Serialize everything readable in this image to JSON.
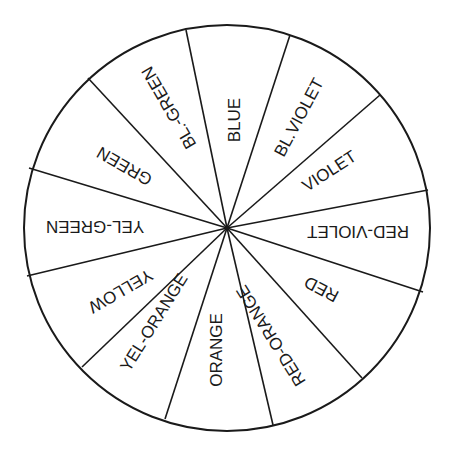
{
  "diagram": {
    "center": [
      227,
      228
    ],
    "radius": 203,
    "stroke_color": "#1a1a1a",
    "background": "#ffffff",
    "segments": [
      {
        "label": "BLUE",
        "x": 236,
        "y": 120,
        "rotate": -90
      },
      {
        "label": "BL.VIOLET",
        "x": 300,
        "y": 118,
        "rotate": -62
      },
      {
        "label": "VIOLET",
        "x": 330,
        "y": 172,
        "rotate": -33
      },
      {
        "label": "RED-VIOLET",
        "x": 358,
        "y": 230,
        "rotate": 180
      },
      {
        "label": "RED",
        "x": 322,
        "y": 288,
        "rotate": 208
      },
      {
        "label": "RED-ORANGE",
        "x": 272,
        "y": 335,
        "rotate": 238
      },
      {
        "label": "ORANGE",
        "x": 218,
        "y": 350,
        "rotate": -90
      },
      {
        "label": "YEL-ORANGE",
        "x": 155,
        "y": 323,
        "rotate": -58
      },
      {
        "label": "YELLOW",
        "x": 120,
        "y": 290,
        "rotate": 150
      },
      {
        "label": "YEL-GREEN",
        "x": 95,
        "y": 225,
        "rotate": 180
      },
      {
        "label": "GREEN",
        "x": 125,
        "y": 165,
        "rotate": 210
      },
      {
        "label": "BL.-GREEN",
        "x": 170,
        "y": 107,
        "rotate": 240
      }
    ],
    "spokes": [
      [
        186,
        30
      ],
      [
        290,
        35
      ],
      [
        380,
        95
      ],
      [
        428,
        190
      ],
      [
        423,
        292
      ],
      [
        362,
        378
      ],
      [
        273,
        425
      ],
      [
        165,
        419
      ],
      [
        82,
        367
      ],
      [
        27,
        276
      ],
      [
        29,
        168
      ],
      [
        88,
        78
      ]
    ]
  }
}
